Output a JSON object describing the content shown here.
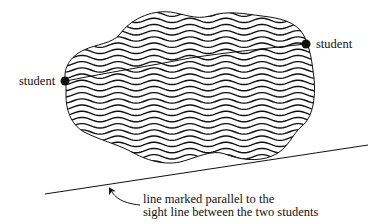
{
  "diagram": {
    "labels": {
      "student_left": "student",
      "student_right": "student",
      "caption_line1": "line marked parallel to the",
      "caption_line2": "sight line between the two students"
    },
    "elements": {
      "lake_region": "wavy-hatched water body (lake)",
      "sight_line": "faint line connecting the two students across the water",
      "parallel_line": "straight line drawn parallel to the sight line",
      "pointer_arrow": "curved arrow from caption to parallel line"
    },
    "colors": {
      "ink": "#111111",
      "background": "#ffffff"
    }
  }
}
